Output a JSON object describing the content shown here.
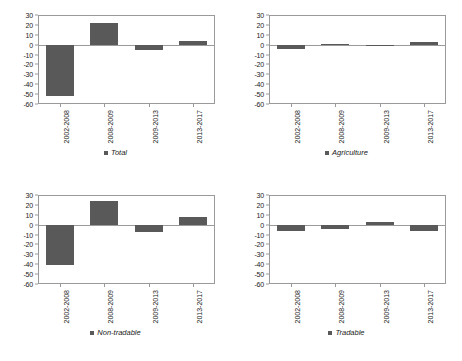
{
  "figure": {
    "panel_count": 4,
    "bar_color": "#595959",
    "axis_color": "#9a9a9a",
    "text_color": "#1a1a1a"
  },
  "axis": {
    "ymin": -60,
    "ymax": 30,
    "ystep": 10,
    "yticks": [
      "30",
      "20",
      "10",
      "0",
      "-10",
      "-20",
      "-30",
      "-40",
      "-50",
      "-60"
    ],
    "categories": [
      "2002-2008",
      "2008-2009",
      "2009-2013",
      "2013-2017"
    ]
  },
  "panels": [
    {
      "legend_label": "Total",
      "legend_icon": "square-marker-icon",
      "values": [
        -52,
        22,
        -5,
        4
      ]
    },
    {
      "legend_label": "Agriculture",
      "legend_icon": "square-marker-icon",
      "values": [
        -4,
        1,
        -0.5,
        3
      ]
    },
    {
      "legend_label": "Non-tradable",
      "legend_icon": "square-marker-icon",
      "values": [
        -41,
        24,
        -7,
        8
      ]
    },
    {
      "legend_label": "Tradable",
      "legend_icon": "square-marker-icon",
      "values": [
        -6,
        -4,
        2.5,
        -6
      ]
    }
  ],
  "chart_data": [
    {
      "type": "bar",
      "title": "Total",
      "categories": [
        "2002-2008",
        "2008-2009",
        "2009-2013",
        "2013-2017"
      ],
      "values": [
        -52,
        22,
        -5,
        4
      ],
      "xlabel": "",
      "ylabel": "",
      "ylim": [
        -60,
        30
      ],
      "yticks": [
        30,
        20,
        10,
        0,
        -10,
        -20,
        -30,
        -40,
        -50,
        -60
      ],
      "grid": false,
      "legend_position": "bottom",
      "legend": [
        "Total"
      ]
    },
    {
      "type": "bar",
      "title": "Agriculture",
      "categories": [
        "2002-2008",
        "2008-2009",
        "2009-2013",
        "2013-2017"
      ],
      "values": [
        -4,
        1,
        -0.5,
        3
      ],
      "xlabel": "",
      "ylabel": "",
      "ylim": [
        -60,
        30
      ],
      "yticks": [
        30,
        20,
        10,
        0,
        -10,
        -20,
        -30,
        -40,
        -50,
        -60
      ],
      "grid": false,
      "legend_position": "bottom",
      "legend": [
        "Agriculture"
      ]
    },
    {
      "type": "bar",
      "title": "Non-tradable",
      "categories": [
        "2002-2008",
        "2008-2009",
        "2009-2013",
        "2013-2017"
      ],
      "values": [
        -41,
        24,
        -7,
        8
      ],
      "xlabel": "",
      "ylabel": "",
      "ylim": [
        -60,
        30
      ],
      "yticks": [
        30,
        20,
        10,
        0,
        -10,
        -20,
        -30,
        -40,
        -50,
        -60
      ],
      "grid": false,
      "legend_position": "bottom",
      "legend": [
        "Non-tradable"
      ]
    },
    {
      "type": "bar",
      "title": "Tradable",
      "categories": [
        "2002-2008",
        "2008-2009",
        "2009-2013",
        "2013-2017"
      ],
      "values": [
        -6,
        -4,
        2.5,
        -6
      ],
      "xlabel": "",
      "ylabel": "",
      "ylim": [
        -60,
        30
      ],
      "yticks": [
        30,
        20,
        10,
        0,
        -10,
        -20,
        -30,
        -40,
        -50,
        -60
      ],
      "grid": false,
      "legend_position": "bottom",
      "legend": [
        "Tradable"
      ]
    }
  ]
}
